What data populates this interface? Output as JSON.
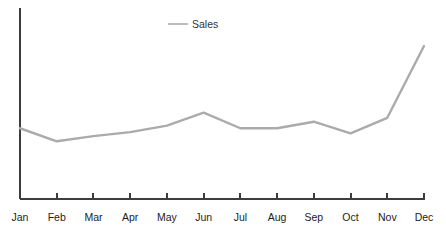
{
  "chart_data": {
    "type": "line",
    "title": "",
    "subtitle": "",
    "xlabel": "",
    "ylabel": "",
    "categories": [
      "Jan",
      "Feb",
      "Mar",
      "Apr",
      "May",
      "Jun",
      "Jul",
      "Aug",
      "Sep",
      "Oct",
      "Nov",
      "Dec"
    ],
    "series": [
      {
        "name": "Sales",
        "values": [
          32,
          22,
          26,
          29,
          34,
          44,
          32,
          32,
          37,
          28,
          40,
          95
        ],
        "color": "#ababab"
      }
    ],
    "ylim": [
      0,
      105
    ],
    "xlim": [
      0,
      11
    ],
    "grid": false,
    "legend": {
      "visible": true,
      "position": "top-center",
      "entries": [
        {
          "label": "Sales",
          "color": "#ababab"
        }
      ]
    },
    "axes": {
      "y_axis_visible": true,
      "y_axis_ticks_visible": false,
      "y_axis_labels_visible": false,
      "x_axis_visible": true,
      "x_axis_ticks_visible": true,
      "x_axis_labels_visible": true,
      "axis_color": "#3d3d3d"
    }
  },
  "style": {
    "background": "#ffffff",
    "line_color": "#ababab",
    "axis_color": "#3d3d3d",
    "label_color": "#1c1c1c",
    "legend_text_color": "#333333",
    "line_width": "2.4"
  },
  "geometry": {
    "width": 446,
    "height": 239,
    "plot_left": 20,
    "plot_right": 424,
    "plot_top": 8,
    "plot_baseline": 199,
    "tick_length": 6,
    "label_baseline_y": 221,
    "legend_line_x1": 168,
    "legend_line_x2": 188,
    "legend_y": 24,
    "legend_text_x": 192,
    "legend_text_baseline": 28,
    "value_top_y": 33,
    "value_bottom_y": 170
  }
}
